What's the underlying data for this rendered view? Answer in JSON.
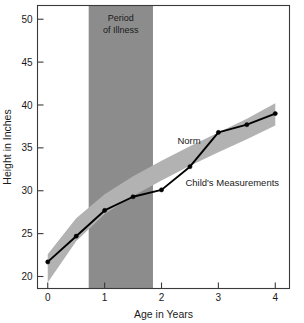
{
  "chart_data": {
    "type": "line",
    "title": "",
    "xlabel": "Age in Years",
    "ylabel": "Height in Inches",
    "xlim": [
      -0.18,
      4.25
    ],
    "ylim": [
      18.6,
      51.6
    ],
    "xticks": [
      0,
      1,
      2,
      3,
      4
    ],
    "xtick_labels": [
      "0",
      "1",
      "2",
      "3",
      "4"
    ],
    "yticks": [
      20,
      25,
      30,
      35,
      40,
      45,
      50
    ],
    "ytick_labels": [
      "20",
      "25",
      "30",
      "35",
      "40",
      "45",
      "50"
    ],
    "grid": false,
    "legend_position": "inline-annotations",
    "series": [
      {
        "name": "Child's Measurements",
        "type": "line",
        "marker": "circle",
        "color": "#000000",
        "x": [
          0,
          0.5,
          1,
          1.5,
          2,
          2.5,
          3,
          3.5,
          4
        ],
        "values": [
          21.7,
          24.7,
          27.7,
          29.3,
          30.1,
          32.8,
          36.8,
          37.7,
          39.0
        ]
      },
      {
        "name": "Norm",
        "type": "area",
        "color": "#b2b2b2",
        "x": [
          0,
          0.5,
          1,
          1.5,
          2,
          2.5,
          3,
          3.5,
          4
        ],
        "upper": [
          22.6,
          26.8,
          29.6,
          31.7,
          33.5,
          35.2,
          36.8,
          38.4,
          40.2
        ],
        "lower": [
          19.3,
          24.1,
          27.3,
          29.4,
          31.2,
          32.9,
          34.5,
          36.0,
          37.6
        ]
      }
    ],
    "shaded_regions": [
      {
        "name": "Period of Illness",
        "orientation": "vertical",
        "x_start": 0.72,
        "x_end": 1.85,
        "color": "#8c8c8c",
        "label_lines": [
          "Period",
          "of Illness"
        ]
      }
    ],
    "annotations": [
      {
        "name": "norm-label",
        "text": "Norm",
        "x": 2.28,
        "y": 35.4
      },
      {
        "name": "child-measurements-label",
        "text": "Child's Measurements",
        "x": 2.42,
        "y": 30.6
      }
    ]
  },
  "axes": {
    "x_title": "Age in Years",
    "y_title": "Height in Inches"
  },
  "colors": {
    "norm_band": "#b2b2b2",
    "illness_band": "#8c8c8c",
    "line": "#000000",
    "frame": "#3a3a3a",
    "background": "#ffffff"
  }
}
